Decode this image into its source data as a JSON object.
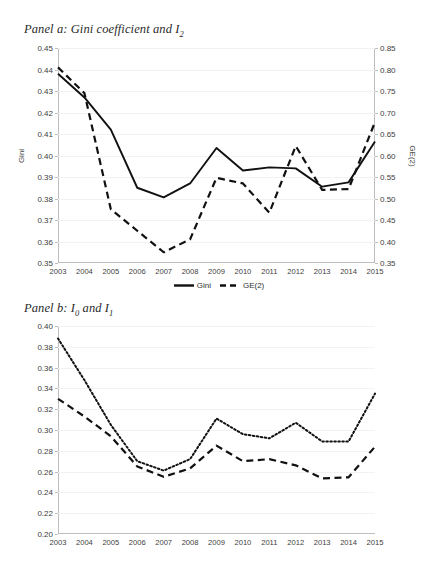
{
  "figure": {
    "background": "#ffffff",
    "line_color": "#111111",
    "axis_color": "#bdbdbd",
    "grid_color": "#f2f2f2"
  },
  "panels": [
    {
      "id": "panel-a",
      "title_prefix": "Panel a: Gini coefficient and I",
      "title_sub": "2",
      "legend": [
        {
          "label": "Gini",
          "style": "solid"
        },
        {
          "label": "GE(2)",
          "style": "dashed"
        }
      ]
    },
    {
      "id": "panel-b",
      "title_prefix": "Panel b: I",
      "title_sub": "0",
      "title_mid": " and I",
      "title_sub2": "1",
      "legend": [
        {
          "label": "GE(0)",
          "style": "dashed"
        },
        {
          "label": "GE(1)",
          "style": "dotted"
        }
      ]
    }
  ],
  "chart_data": [
    {
      "type": "line",
      "title": "Panel a: Gini coefficient and I2",
      "xlabel": "",
      "ylabel": "Gini",
      "y2label": "GE(2)",
      "ylim": [
        0.35,
        0.45
      ],
      "ytick_step": 0.01,
      "y2lim": [
        0.35,
        0.85
      ],
      "y2tick_step": 0.05,
      "yticks": [
        "0.35",
        "0.36",
        "0.37",
        "0.38",
        "0.39",
        "0.40",
        "0.41",
        "0.42",
        "0.43",
        "0.44",
        "0.45"
      ],
      "y2ticks": [
        "0.35",
        "0.40",
        "0.45",
        "0.50",
        "0.55",
        "0.60",
        "0.65",
        "0.70",
        "0.75",
        "0.80",
        "0.85"
      ],
      "grid": true,
      "legend_position": "bottom",
      "categories": [
        "2003",
        "2004",
        "2005",
        "2006",
        "2007",
        "2008",
        "2009",
        "2010",
        "2011",
        "2012",
        "2013",
        "2014",
        "2015"
      ],
      "series": [
        {
          "name": "Gini",
          "axis": "left",
          "style": "solid",
          "values": [
            0.438,
            0.427,
            0.412,
            0.385,
            0.3805,
            0.387,
            0.4035,
            0.393,
            0.3945,
            0.394,
            0.3855,
            0.3875,
            0.4065
          ]
        },
        {
          "name": "GE(2)",
          "axis": "right",
          "style": "dashed",
          "values": [
            0.805,
            0.745,
            0.475,
            0.425,
            0.375,
            0.405,
            0.548,
            0.535,
            0.467,
            0.622,
            0.52,
            0.522,
            0.678
          ]
        }
      ]
    },
    {
      "type": "line",
      "title": "Panel b: I0 and I1",
      "xlabel": "",
      "ylabel": "",
      "ylim": [
        0.2,
        0.4
      ],
      "ytick_step": 0.02,
      "yticks": [
        "0.20",
        "0.22",
        "0.24",
        "0.26",
        "0.28",
        "0.30",
        "0.32",
        "0.34",
        "0.36",
        "0.38",
        "0.40"
      ],
      "grid": true,
      "legend_position": "bottom",
      "categories": [
        "2003",
        "2004",
        "2005",
        "2006",
        "2007",
        "2008",
        "2009",
        "2010",
        "2011",
        "2012",
        "2013",
        "2014",
        "2015"
      ],
      "series": [
        {
          "name": "GE(0)",
          "axis": "left",
          "style": "dashed",
          "values": [
            0.33,
            0.313,
            0.294,
            0.265,
            0.255,
            0.263,
            0.285,
            0.27,
            0.272,
            0.266,
            0.2535,
            0.2545,
            0.284
          ]
        },
        {
          "name": "GE(1)",
          "axis": "left",
          "style": "dotted",
          "values": [
            0.388,
            0.348,
            0.305,
            0.27,
            0.261,
            0.272,
            0.311,
            0.296,
            0.292,
            0.307,
            0.289,
            0.289,
            0.335
          ]
        }
      ]
    }
  ]
}
